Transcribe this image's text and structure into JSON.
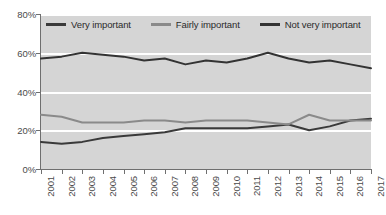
{
  "chart_data": {
    "type": "line",
    "title": "",
    "subtitle": "",
    "xlabel": "",
    "ylabel": "",
    "grid": true,
    "legend_position": "top-inside",
    "categories": [
      "2001",
      "2002",
      "2003",
      "2004",
      "2005",
      "2006",
      "2007",
      "2008",
      "2009",
      "2010",
      "2011",
      "2012",
      "2013",
      "2014",
      "2015",
      "2016",
      "2017"
    ],
    "x": [
      2001,
      2002,
      2003,
      2004,
      2005,
      2006,
      2007,
      2008,
      2009,
      2010,
      2011,
      2012,
      2013,
      2014,
      2015,
      2016,
      2017
    ],
    "ylim": [
      0,
      80
    ],
    "yticks": [
      0,
      20,
      40,
      60,
      80
    ],
    "ytick_labels": [
      "0%",
      "20%",
      "40%",
      "60%",
      "80%"
    ],
    "series": [
      {
        "name": "Very important",
        "color": "#3a3a3a",
        "values": [
          14,
          13,
          14,
          16,
          17,
          18,
          19,
          21,
          21,
          21,
          21,
          22,
          23,
          20,
          22,
          25,
          26
        ]
      },
      {
        "name": "Fairly important",
        "color": "#8a8a8a",
        "values": [
          28,
          27,
          24,
          24,
          24,
          25,
          25,
          24,
          25,
          25,
          25,
          24,
          23,
          28,
          25,
          25,
          25
        ]
      },
      {
        "name": "Not very important",
        "color": "#333333",
        "values": [
          57,
          58,
          60,
          59,
          58,
          56,
          57,
          54,
          56,
          55,
          57,
          60,
          57,
          55,
          56,
          54,
          52
        ]
      }
    ]
  },
  "legend": {
    "items": [
      {
        "label": "Very important",
        "color": "#3a3a3a"
      },
      {
        "label": "Fairly important",
        "color": "#8a8a8a"
      },
      {
        "label": "Not very important",
        "color": "#333333"
      }
    ]
  },
  "axes": {
    "y": {
      "labels": [
        "80%",
        "60%",
        "40%",
        "20%",
        "0%"
      ],
      "values": [
        80,
        60,
        40,
        20,
        0
      ]
    },
    "x": {
      "labels": [
        "2001",
        "2002",
        "2003",
        "2004",
        "2005",
        "2006",
        "2007",
        "2008",
        "2009",
        "2010",
        "2011",
        "2012",
        "2013",
        "2014",
        "2015",
        "2016",
        "2017"
      ]
    }
  },
  "colors": {
    "plot_background": "#d5d5d5",
    "gridline": "#ffffff",
    "axis": "#6f6f6f",
    "tick_text": "#4a4a4a",
    "legend_text": "#2b2b2b"
  }
}
